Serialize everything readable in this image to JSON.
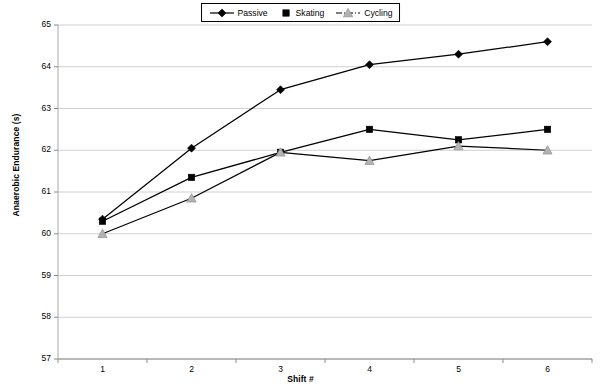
{
  "chart_data": {
    "type": "line",
    "title": "",
    "xlabel": "Shift #",
    "ylabel": "Anaerobic Endurance (s)",
    "categories": [
      "1",
      "2",
      "3",
      "4",
      "5",
      "6"
    ],
    "x": [
      1,
      2,
      3,
      4,
      5,
      6
    ],
    "xlim": [
      0.5,
      6.5
    ],
    "ylim": [
      57,
      65
    ],
    "ytick_labels": [
      "57",
      "58",
      "59",
      "60",
      "61",
      "62",
      "63",
      "64",
      "65"
    ],
    "yticks": [
      57,
      58,
      59,
      60,
      61,
      62,
      63,
      64,
      65
    ],
    "grid": "horizontal",
    "legend_position": "top-center",
    "series": [
      {
        "name": "Passive",
        "marker": "diamond",
        "line_style": "solid",
        "color": "#000000",
        "values": [
          60.35,
          62.05,
          63.45,
          64.05,
          64.3,
          64.6
        ]
      },
      {
        "name": "Skating",
        "marker": "square",
        "line_style": "solid",
        "color": "#000000",
        "values": [
          60.3,
          61.35,
          61.95,
          62.5,
          62.25,
          62.5
        ]
      },
      {
        "name": "Cycling",
        "marker": "triangle",
        "line_style": "dash-dot",
        "color": "#000000",
        "marker_fill": "#b3b3b3",
        "values": [
          60.0,
          60.85,
          61.95,
          61.75,
          62.1,
          62.0
        ]
      }
    ]
  },
  "legend": {
    "items": [
      {
        "label": "Passive",
        "icon": "diamond-marker-icon"
      },
      {
        "label": "Skating",
        "icon": "square-marker-icon"
      },
      {
        "label": "Cycling",
        "icon": "triangle-marker-icon"
      }
    ]
  }
}
